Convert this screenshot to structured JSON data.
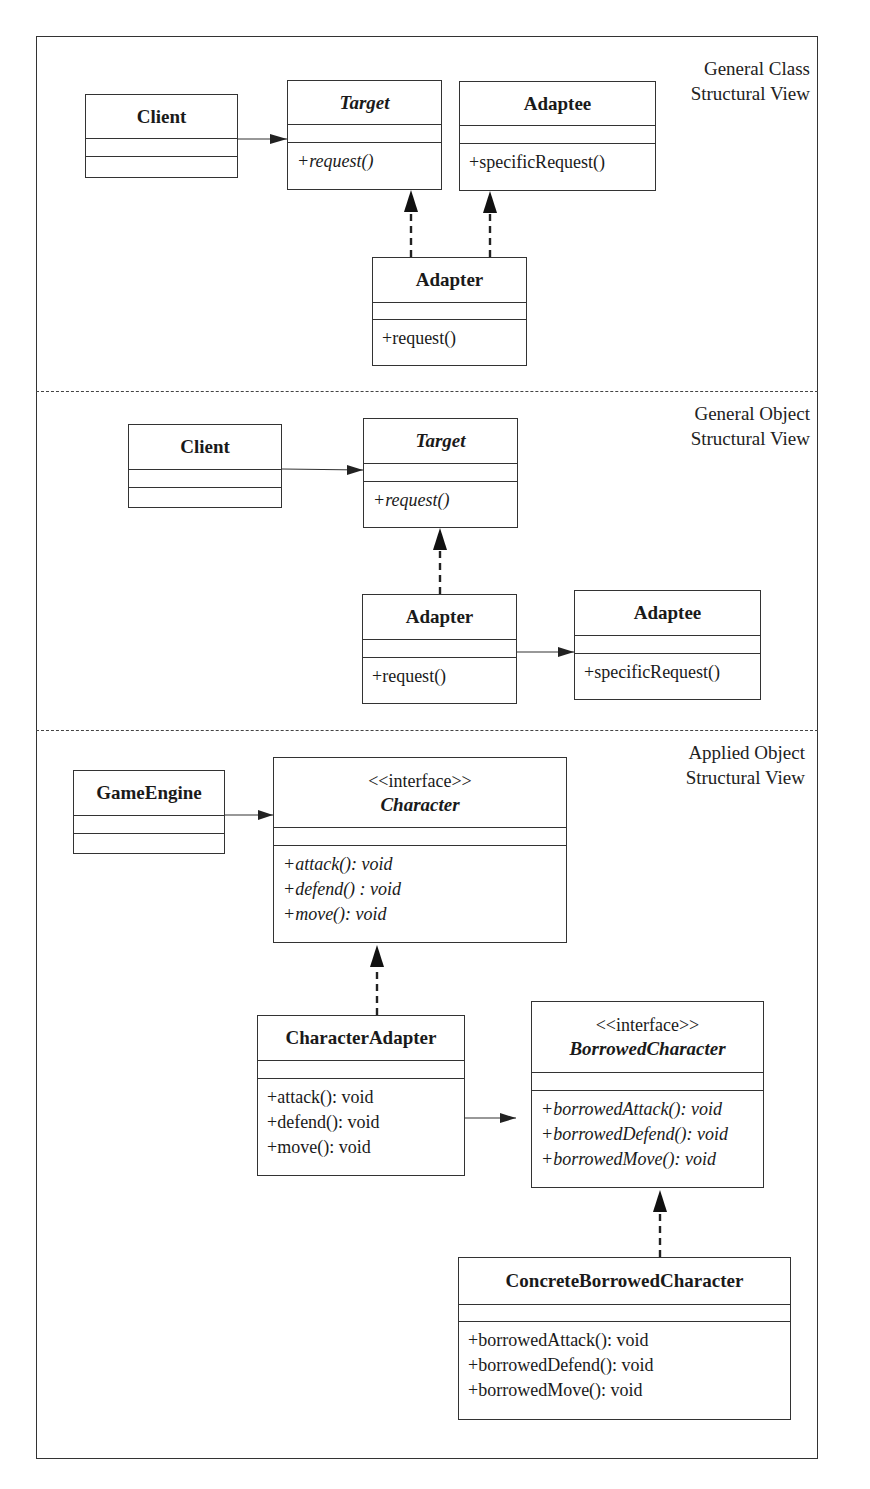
{
  "sections": [
    {
      "label_line1": "General Class",
      "label_line2": "Structural View"
    },
    {
      "label_line1": "General Object",
      "label_line2": "Structural View"
    },
    {
      "label_line1": "Applied Object",
      "label_line2": "Structural View"
    }
  ],
  "class_view": {
    "client": {
      "name": "Client",
      "operations": []
    },
    "target": {
      "name": "Target",
      "abstract": true,
      "operations": [
        "+request()"
      ]
    },
    "adaptee": {
      "name": "Adaptee",
      "operations": [
        "+specificRequest()"
      ]
    },
    "adapter": {
      "name": "Adapter",
      "operations": [
        "+request()"
      ]
    }
  },
  "object_view": {
    "client": {
      "name": "Client",
      "operations": []
    },
    "target": {
      "name": "Target",
      "abstract": true,
      "operations": [
        "+request()"
      ]
    },
    "adapter": {
      "name": "Adapter",
      "operations": [
        "+request()"
      ]
    },
    "adaptee": {
      "name": "Adaptee",
      "operations": [
        "+specificRequest()"
      ]
    }
  },
  "applied_view": {
    "game_engine": {
      "name": "GameEngine",
      "operations": []
    },
    "character": {
      "stereotype": "<<interface>>",
      "name": "Character",
      "operations": [
        "+attack(): void",
        "+defend() : void",
        "+move(): void"
      ]
    },
    "character_adapter": {
      "name": "CharacterAdapter",
      "operations": [
        "+attack(): void",
        "+defend(): void",
        "+move(): void"
      ]
    },
    "borrowed_character": {
      "stereotype": "<<interface>>",
      "name": "BorrowedCharacter",
      "operations": [
        "+borrowedAttack(): void",
        "+borrowedDefend(): void",
        "+borrowedMove(): void"
      ]
    },
    "concrete_borrowed_character": {
      "name": "ConcreteBorrowedCharacter",
      "operations": [
        "+borrowedAttack(): void",
        "+borrowedDefend(): void",
        "+borrowedMove(): void"
      ]
    }
  },
  "colors": {
    "line": "#333333",
    "background": "#ffffff",
    "text": "#1a1a1a"
  }
}
